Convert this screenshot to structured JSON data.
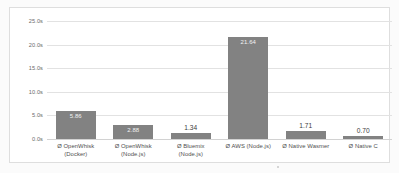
{
  "chart_data": {
    "type": "bar",
    "title": "",
    "subtitle": "",
    "xlabel": "",
    "ylabel": "",
    "categories": [
      "Ø OpenWhisk (Docker)",
      "Ø OpenWhisk (Node.js)",
      "Ø Bluemix (Node.js)",
      "Ø AWS (Node.js)",
      "Ø Native Wasmer",
      "Ø Native C"
    ],
    "category_lines": [
      [
        "Ø OpenWhisk",
        "(Docker)"
      ],
      [
        "Ø OpenWhisk",
        "(Node.js)"
      ],
      [
        "Ø Bluemix",
        "(Node.js)"
      ],
      [
        "Ø AWS (Node.js)"
      ],
      [
        "Ø Native Wasmer"
      ],
      [
        "Ø Native C"
      ]
    ],
    "values": [
      5.86,
      2.88,
      1.34,
      21.64,
      1.71,
      0.7
    ],
    "data_labels": [
      "5.86",
      "2.88",
      "1.34",
      "21.64",
      "1.71",
      "0.70"
    ],
    "label_placement": [
      "inside",
      "inside",
      "above",
      "inside",
      "above",
      "above"
    ],
    "ylim": [
      0,
      25
    ],
    "ytick_values": [
      25,
      20,
      15,
      10,
      5,
      0
    ],
    "ytick_labels": [
      "25.0s",
      "20.0s",
      "15.0s",
      "10.0s",
      "5.0s",
      "0.0s"
    ],
    "unit": "s",
    "grid": true,
    "grid_axis": "y",
    "legend": false,
    "legend_position": "none",
    "series": [
      {
        "name": "Execution time",
        "values": [
          5.86,
          2.88,
          1.34,
          21.64,
          1.71,
          0.7
        ]
      }
    ],
    "colors": {
      "bar": "#828282",
      "gridline": "#e2e2e2",
      "baseline": "#d2d2d2",
      "plot_background": "#ffffff",
      "figure_background": "#fbfbfb",
      "frame_border": "#dedede",
      "tick_label": "#6a6a6a",
      "category_label": "#4f4f4f",
      "label_inside": "#f2f2f2",
      "label_above": "#3c3c3c"
    }
  }
}
